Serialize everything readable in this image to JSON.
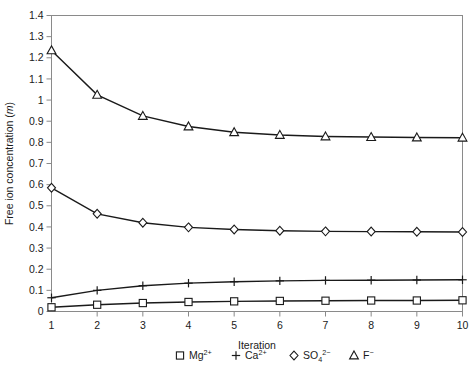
{
  "chart_data": {
    "type": "line",
    "title": "",
    "xlabel": "Iteration",
    "ylabel": "Free ion concentration (m)",
    "ylabel_italic_part": "m",
    "x": [
      1,
      2,
      3,
      4,
      5,
      6,
      7,
      8,
      9,
      10
    ],
    "xlim": [
      1,
      10
    ],
    "ylim": [
      0,
      1.4
    ],
    "ytick_labels": [
      "0",
      "0.1",
      "0.2",
      "0.3",
      "0.4",
      "0.5",
      "0.6",
      "0.7",
      "0.8",
      "0.9",
      "1",
      "1.1",
      "1.2",
      "1.3",
      "1.4"
    ],
    "ytick_values": [
      0,
      0.1,
      0.2,
      0.3,
      0.4,
      0.5,
      0.6,
      0.7,
      0.8,
      0.9,
      1.0,
      1.1,
      1.2,
      1.3,
      1.4
    ],
    "xtick_labels": [
      "1",
      "2",
      "3",
      "4",
      "5",
      "6",
      "7",
      "8",
      "9",
      "10"
    ],
    "grid": false,
    "legend_position": "bottom",
    "series": [
      {
        "name": "Mg2+",
        "label_base": "Mg",
        "label_sup": "2+",
        "label_sub": "",
        "marker": "square",
        "values": [
          0.02,
          0.032,
          0.04,
          0.045,
          0.048,
          0.05,
          0.051,
          0.052,
          0.052,
          0.053
        ]
      },
      {
        "name": "Ca2+",
        "label_base": "Ca",
        "label_sup": "2+",
        "label_sub": "",
        "marker": "plus",
        "values": [
          0.065,
          0.1,
          0.122,
          0.134,
          0.141,
          0.145,
          0.147,
          0.148,
          0.149,
          0.15
        ]
      },
      {
        "name": "SO42-",
        "label_base": "SO",
        "label_sup": "2−",
        "label_sub": "4",
        "marker": "diamond",
        "values": [
          0.585,
          0.462,
          0.42,
          0.398,
          0.388,
          0.382,
          0.379,
          0.378,
          0.377,
          0.376
        ]
      },
      {
        "name": "F-",
        "label_base": "F",
        "label_sup": "−",
        "label_sub": "",
        "marker": "triangle",
        "values": [
          1.235,
          1.025,
          0.925,
          0.875,
          0.848,
          0.835,
          0.828,
          0.825,
          0.823,
          0.822
        ]
      }
    ]
  },
  "legend": {
    "entries": [
      {
        "marker": "square",
        "base": "Mg",
        "sup": "2+",
        "sub": ""
      },
      {
        "marker": "plus",
        "base": "Ca",
        "sup": "2+",
        "sub": ""
      },
      {
        "marker": "diamond",
        "base": "SO",
        "sup": "2−",
        "sub": "4"
      },
      {
        "marker": "triangle",
        "base": "F",
        "sup": "−",
        "sub": ""
      }
    ]
  },
  "axes": {
    "x_title": "Iteration",
    "y_title_prefix": "Free ion concentration (",
    "y_title_italic": "m",
    "y_title_suffix": ")"
  }
}
